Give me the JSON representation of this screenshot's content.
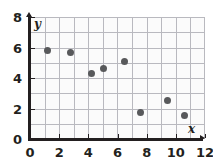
{
  "chart_data": {
    "type": "scatter",
    "title": "",
    "xlabel": "x",
    "ylabel": "y",
    "xlim": [
      0,
      12
    ],
    "ylim": [
      0,
      8
    ],
    "grid": true,
    "grid_step_x": 1,
    "grid_step_y": 1,
    "legend": "none",
    "x_ticks": [
      0,
      2,
      4,
      6,
      8,
      10,
      12
    ],
    "y_ticks": [
      0,
      2,
      4,
      6,
      8
    ],
    "x_tick_labels": [
      "0",
      "2",
      "4",
      "6",
      "8",
      "10",
      "12"
    ],
    "y_tick_labels": [
      "0",
      "2",
      "4",
      "6",
      "8"
    ],
    "point_color": "#58595b",
    "grid_color": "#b9b9bf",
    "axis_color": "#231f20",
    "points": [
      {
        "x": 1.2,
        "y": 5.8
      },
      {
        "x": 2.8,
        "y": 5.65
      },
      {
        "x": 4.25,
        "y": 4.3
      },
      {
        "x": 5.05,
        "y": 4.6
      },
      {
        "x": 6.45,
        "y": 5.05
      },
      {
        "x": 7.55,
        "y": 1.75
      },
      {
        "x": 9.4,
        "y": 2.55
      },
      {
        "x": 10.6,
        "y": 1.55
      }
    ]
  },
  "axis_names": {
    "y": "y",
    "x": "x"
  }
}
